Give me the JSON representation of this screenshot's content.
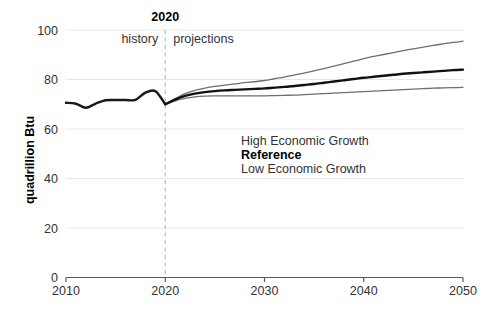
{
  "chart_data": {
    "type": "line",
    "title": "",
    "xlabel": "",
    "ylabel": "quadrillion Btu",
    "xlim": [
      2010,
      2050
    ],
    "ylim": [
      0,
      100
    ],
    "xticks": [
      "2010",
      "2020",
      "2030",
      "2040",
      "2050"
    ],
    "yticks": [
      "0",
      "20",
      "40",
      "60",
      "80",
      "100"
    ],
    "grid": "horizontal",
    "legend_position": "inside-center",
    "annotations": {
      "divider_year": "2020",
      "divider_left": "history",
      "divider_right": "projections",
      "divider_x": 2020
    },
    "x": [
      2010,
      2011,
      2012,
      2013,
      2014,
      2015,
      2016,
      2017,
      2018,
      2019,
      2020,
      2021,
      2022,
      2023,
      2024,
      2025,
      2026,
      2027,
      2028,
      2029,
      2030,
      2031,
      2032,
      2033,
      2034,
      2035,
      2036,
      2037,
      2038,
      2039,
      2040,
      2041,
      2042,
      2043,
      2044,
      2045,
      2046,
      2047,
      2048,
      2049,
      2050
    ],
    "series": [
      {
        "name": "history",
        "label": "history",
        "color": "#1a1a1a",
        "width": 2.4,
        "values": [
          70.6,
          70.2,
          68.6,
          70.3,
          71.6,
          71.7,
          71.7,
          71.8,
          74.7,
          75.3,
          70.0,
          null,
          null,
          null,
          null,
          null,
          null,
          null,
          null,
          null,
          null,
          null,
          null,
          null,
          null,
          null,
          null,
          null,
          null,
          null,
          null,
          null,
          null,
          null,
          null,
          null,
          null,
          null,
          null,
          null,
          null
        ]
      },
      {
        "name": "high-economic-growth",
        "label": "High Economic Growth",
        "color": "#6d6e71",
        "width": 1.3,
        "values": [
          null,
          null,
          null,
          null,
          null,
          null,
          null,
          null,
          null,
          null,
          70.0,
          72.3,
          74.3,
          75.6,
          76.5,
          77.2,
          77.7,
          78.2,
          78.7,
          79.1,
          79.6,
          80.3,
          81.0,
          81.8,
          82.6,
          83.5,
          84.4,
          85.4,
          86.4,
          87.4,
          88.4,
          89.3,
          90.1,
          90.9,
          91.7,
          92.4,
          93.1,
          93.8,
          94.4,
          95.0,
          95.5
        ]
      },
      {
        "name": "reference",
        "label": "Reference",
        "color": "#111111",
        "width": 2.4,
        "values": [
          null,
          null,
          null,
          null,
          null,
          null,
          null,
          null,
          null,
          null,
          70.0,
          71.9,
          73.4,
          74.3,
          74.9,
          75.3,
          75.6,
          75.8,
          76.0,
          76.2,
          76.4,
          76.7,
          77.0,
          77.4,
          77.8,
          78.2,
          78.7,
          79.2,
          79.7,
          80.2,
          80.7,
          81.1,
          81.5,
          81.9,
          82.3,
          82.6,
          82.9,
          83.2,
          83.5,
          83.8,
          84.0
        ]
      },
      {
        "name": "low-economic-growth",
        "label": "Low Economic Growth",
        "color": "#6d6e71",
        "width": 1.3,
        "values": [
          null,
          null,
          null,
          null,
          null,
          null,
          null,
          null,
          null,
          null,
          70.0,
          71.4,
          72.4,
          73.0,
          73.3,
          73.4,
          73.4,
          73.4,
          73.4,
          73.4,
          73.4,
          73.5,
          73.6,
          73.7,
          73.9,
          74.1,
          74.3,
          74.5,
          74.7,
          74.9,
          75.1,
          75.3,
          75.5,
          75.7,
          75.9,
          76.1,
          76.3,
          76.5,
          76.6,
          76.7,
          76.8
        ]
      }
    ],
    "legend": [
      {
        "label": "High Economic Growth",
        "bold": false
      },
      {
        "label": "Reference",
        "bold": true
      },
      {
        "label": "Low Economic Growth",
        "bold": false
      }
    ],
    "colors": {
      "reference": "#111111",
      "scenario": "#6d6e71",
      "axis": "#58595b",
      "grid": "#e8e8e8",
      "divider": "#bcbcbc",
      "background": "#ffffff"
    }
  }
}
